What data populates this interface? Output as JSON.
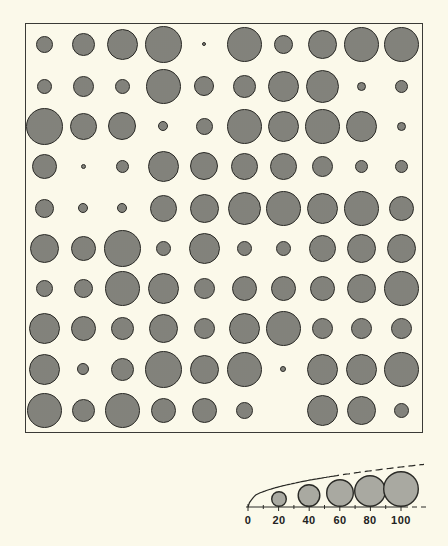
{
  "figure": {
    "type": "proportional-symbol-grid",
    "rows": 10,
    "cols": 10,
    "frame": {
      "left": 25,
      "top": 23,
      "width": 398,
      "height": 410
    },
    "col_centers_x": [
      44,
      83,
      122,
      163,
      204,
      244,
      283,
      322,
      361,
      401
    ],
    "row_centers_y": [
      44,
      86,
      126,
      166,
      208,
      248,
      288,
      328,
      369,
      410
    ],
    "colors": {
      "background": "#fbf9ea",
      "fill": "#a9a9a1",
      "stroke": "#2a2a26"
    },
    "diameters_px": [
      [
        17,
        23,
        31,
        37,
        4,
        35,
        19,
        29,
        35,
        35
      ],
      [
        15,
        21,
        15,
        35,
        20,
        23,
        31,
        33,
        9,
        13
      ],
      [
        37,
        27,
        28,
        10,
        17,
        35,
        31,
        35,
        31,
        9
      ],
      [
        25,
        5,
        13,
        31,
        28,
        27,
        27,
        21,
        13,
        13
      ],
      [
        19,
        10,
        10,
        27,
        29,
        33,
        35,
        31,
        35,
        25
      ],
      [
        29,
        25,
        37,
        15,
        31,
        15,
        15,
        27,
        29,
        29
      ],
      [
        17,
        19,
        35,
        31,
        21,
        25,
        25,
        25,
        29,
        35
      ],
      [
        31,
        25,
        23,
        29,
        21,
        31,
        35,
        21,
        21,
        21
      ],
      [
        31,
        12,
        23,
        37,
        29,
        35,
        6,
        31,
        31,
        35
      ],
      [
        35,
        23,
        35,
        25,
        25,
        17,
        0,
        31,
        29,
        15
      ]
    ]
  },
  "legend": {
    "axis": {
      "y": 507,
      "x_start": 246,
      "x_end": 426,
      "zero_x": 248,
      "px_per_unit": 1.53
    },
    "ticks": [
      {
        "value": 0,
        "label": "0",
        "x": 248
      },
      {
        "value": 20,
        "label": "20",
        "x": 279
      },
      {
        "value": 40,
        "label": "40",
        "x": 309
      },
      {
        "value": 60,
        "label": "60",
        "x": 340
      },
      {
        "value": 80,
        "label": "80",
        "x": 370
      },
      {
        "value": 100,
        "label": "100",
        "x": 401
      }
    ],
    "circles": [
      {
        "value": 20,
        "x": 279,
        "d": 16
      },
      {
        "value": 40,
        "x": 309,
        "d": 23
      },
      {
        "value": 60,
        "x": 340,
        "d": 28
      },
      {
        "value": 80,
        "x": 370,
        "d": 32
      },
      {
        "value": 100,
        "x": 401,
        "d": 36
      }
    ]
  }
}
